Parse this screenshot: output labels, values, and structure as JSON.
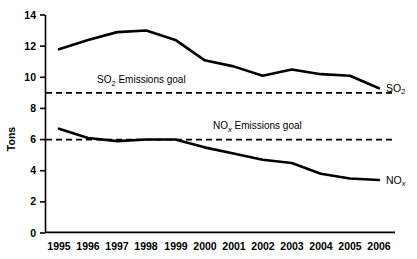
{
  "chart_data": {
    "type": "line",
    "title": "",
    "xlabel": "",
    "ylabel": "Tons",
    "ylim": [
      0,
      14
    ],
    "ytick_values": [
      0,
      2,
      4,
      6,
      8,
      10,
      12,
      14
    ],
    "ytick_labels": [
      "0",
      "2",
      "4",
      "6",
      "8",
      "10",
      "12",
      "14"
    ],
    "grid": false,
    "legend_position": "inline-right-of-line-end",
    "categories": [
      "1995",
      "1996",
      "1997",
      "1998",
      "1999",
      "2000",
      "2001",
      "2002",
      "2003",
      "2004",
      "2005",
      "2006"
    ],
    "x": [
      1995,
      1996,
      1997,
      1998,
      1999,
      2000,
      2001,
      2002,
      2003,
      2004,
      2005,
      2006
    ],
    "series": [
      {
        "name": "SO2",
        "label_main": "SO",
        "label_sub": "2",
        "values": [
          11.8,
          12.4,
          12.9,
          13.0,
          12.4,
          11.1,
          10.7,
          10.1,
          10.5,
          10.2,
          10.1,
          9.3
        ]
      },
      {
        "name": "NOx",
        "label_main": "NO",
        "label_sub": "x",
        "values": [
          6.7,
          6.1,
          5.9,
          6.0,
          6.0,
          5.5,
          5.1,
          4.7,
          4.5,
          3.8,
          3.5,
          3.4
        ]
      }
    ],
    "reference_lines": [
      {
        "name": "so2-emissions-goal",
        "value": 9,
        "style": "dashed",
        "label_main": "SO",
        "label_sub": "2",
        "label_rest": " Emissions goal"
      },
      {
        "name": "nox-emissions-goal",
        "value": 6,
        "style": "dashed",
        "label_main": "NO",
        "label_sub": "x",
        "label_rest": " Emissions goal"
      }
    ],
    "colors": {
      "line": "#000000",
      "axis": "#000000",
      "background": "#ffffff"
    }
  }
}
